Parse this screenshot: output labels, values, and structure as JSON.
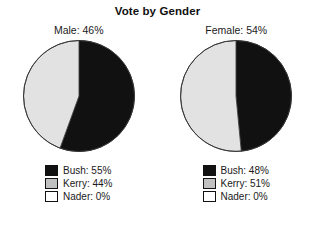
{
  "chart_data": {
    "type": "pie",
    "title": "Vote by Gender",
    "xlabel": "",
    "ylabel": "",
    "legend_position": "below",
    "grid": false,
    "panels": [
      {
        "label": "Male: 46%",
        "group": "Male",
        "group_share_pct": 46,
        "categories": [
          "Bush",
          "Kerry",
          "Nader"
        ],
        "values": [
          55,
          44,
          0
        ],
        "legend": [
          {
            "label": "Bush: 55%",
            "name": "Bush",
            "value": 55,
            "color": "#111111"
          },
          {
            "label": "Kerry: 44%",
            "name": "Kerry",
            "value": 44,
            "color": "#c0c0c0"
          },
          {
            "label": "Nader: 0%",
            "name": "Nader",
            "value": 0,
            "color": "#ffffff"
          }
        ]
      },
      {
        "label": "Female: 54%",
        "group": "Female",
        "group_share_pct": 54,
        "categories": [
          "Bush",
          "Kerry",
          "Nader"
        ],
        "values": [
          48,
          51,
          0
        ],
        "legend": [
          {
            "label": "Bush: 48%",
            "name": "Bush",
            "value": 48,
            "color": "#111111"
          },
          {
            "label": "Kerry: 51%",
            "name": "Kerry",
            "value": 51,
            "color": "#c0c0c0"
          },
          {
            "label": "Nader: 0%",
            "name": "Nader",
            "value": 0,
            "color": "#ffffff"
          }
        ]
      }
    ],
    "slice_colors": {
      "Bush": "#111111",
      "Kerry": "#e2e2e2",
      "Nader": "#ffffff"
    },
    "slice_border_color": "#333333"
  }
}
